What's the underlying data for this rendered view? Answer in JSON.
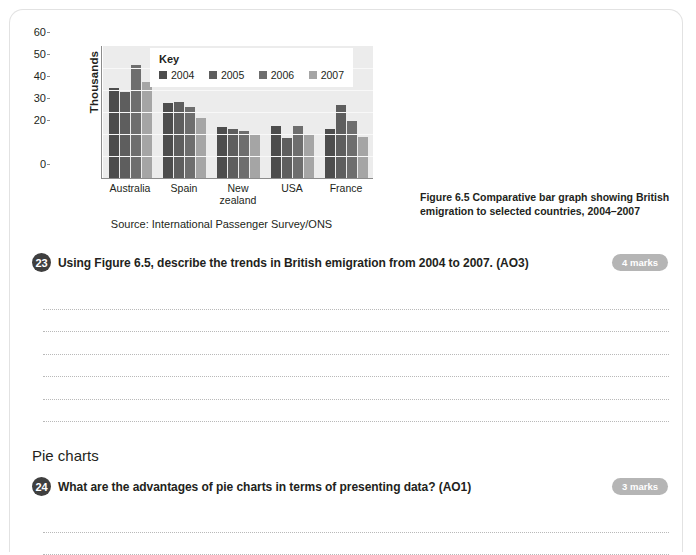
{
  "figure": {
    "caption": "Figure 6.5 Comparative bar graph showing British emigration to selected countries, 2004–2007",
    "source": "Source: International Passenger Survey/ONS"
  },
  "chart_data": {
    "type": "bar",
    "title": "",
    "xlabel": "",
    "ylabel": "Thousands",
    "ylim": [
      0,
      60
    ],
    "yticks": [
      "0",
      "20",
      "30",
      "40",
      "50",
      "60"
    ],
    "grid": true,
    "legend_title": "Key",
    "legend_position": "top-inside",
    "categories": [
      "Australia",
      "Spain",
      "New zealand",
      "USA",
      "France"
    ],
    "series": [
      {
        "name": "2004",
        "color": "#4d4d4d",
        "values": [
          41,
          34,
          23,
          23.5,
          22.2
        ]
      },
      {
        "name": "2005",
        "color": "#5e5e5e",
        "values": [
          39.2,
          34.6,
          22.3,
          18.4,
          33
        ]
      },
      {
        "name": "2006",
        "color": "#6e6e6e",
        "values": [
          51.2,
          32.3,
          21.4,
          23.6,
          26.1
        ]
      },
      {
        "name": "2007",
        "color": "#a5a5a5",
        "values": [
          43.7,
          27.1,
          19.6,
          19.4,
          18.5
        ]
      }
    ]
  },
  "questions": [
    {
      "number": "23",
      "text": "Using Figure 6.5, describe the trends in British emigration from 2004 to 2007. (AO3)",
      "marks": "4 marks",
      "answer_lines": 6
    },
    {
      "number": "24",
      "text": "What are the advantages of pie charts in terms of presenting data? (AO1)",
      "marks": "3 marks",
      "answer_lines": 2
    }
  ],
  "section_heading": "Pie charts",
  "colors": {
    "plot_background": "#ececec",
    "badge": "#b5b5b5",
    "question_circle": "#3f3f3f",
    "card_border": "#e2e2e2"
  }
}
